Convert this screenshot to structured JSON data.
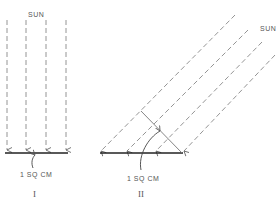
{
  "figure": {
    "panels": [
      {
        "id": "I",
        "roman_label": "I",
        "sun_label": "SUN",
        "area_label": "1 SQ CM",
        "description": "Sun rays striking surface perpendicularly"
      },
      {
        "id": "II",
        "roman_label": "II",
        "sun_label": "SUN",
        "area_label": "1 SQ CM",
        "description": "Sun rays striking surface at an oblique angle"
      }
    ],
    "colors": {
      "ray": "#888888",
      "surface": "#222222",
      "text": "#555555"
    }
  }
}
